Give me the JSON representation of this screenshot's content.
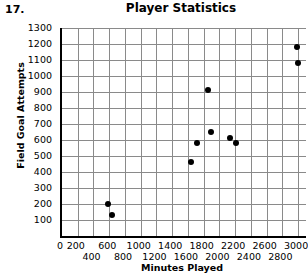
{
  "problem_number": "17.",
  "chart_data": {
    "type": "scatter",
    "title": "Player Statistics",
    "xlabel": "Minutes Played",
    "ylabel": "Field Goal Attempts",
    "xlim": [
      0,
      3100
    ],
    "ylim": [
      0,
      1300
    ],
    "grid": true,
    "legend": false,
    "x_ticks": [
      0,
      200,
      400,
      600,
      800,
      1000,
      1200,
      1400,
      1600,
      1800,
      2000,
      2200,
      2400,
      2600,
      2800,
      3000
    ],
    "y_ticks": [
      100,
      200,
      300,
      400,
      500,
      600,
      700,
      800,
      900,
      1000,
      1100,
      1200,
      1300
    ],
    "x_tick_step": 200,
    "y_tick_step": 100,
    "x_labels_staggered": true,
    "point_color": "#000000",
    "grid_color": "#8a8a8a",
    "points": [
      {
        "x": 580,
        "y": 200
      },
      {
        "x": 630,
        "y": 130
      },
      {
        "x": 1640,
        "y": 460
      },
      {
        "x": 1720,
        "y": 580
      },
      {
        "x": 1860,
        "y": 910
      },
      {
        "x": 1890,
        "y": 650
      },
      {
        "x": 2140,
        "y": 615
      },
      {
        "x": 2210,
        "y": 580
      },
      {
        "x": 2990,
        "y": 1180
      },
      {
        "x": 3000,
        "y": 1080
      }
    ]
  }
}
